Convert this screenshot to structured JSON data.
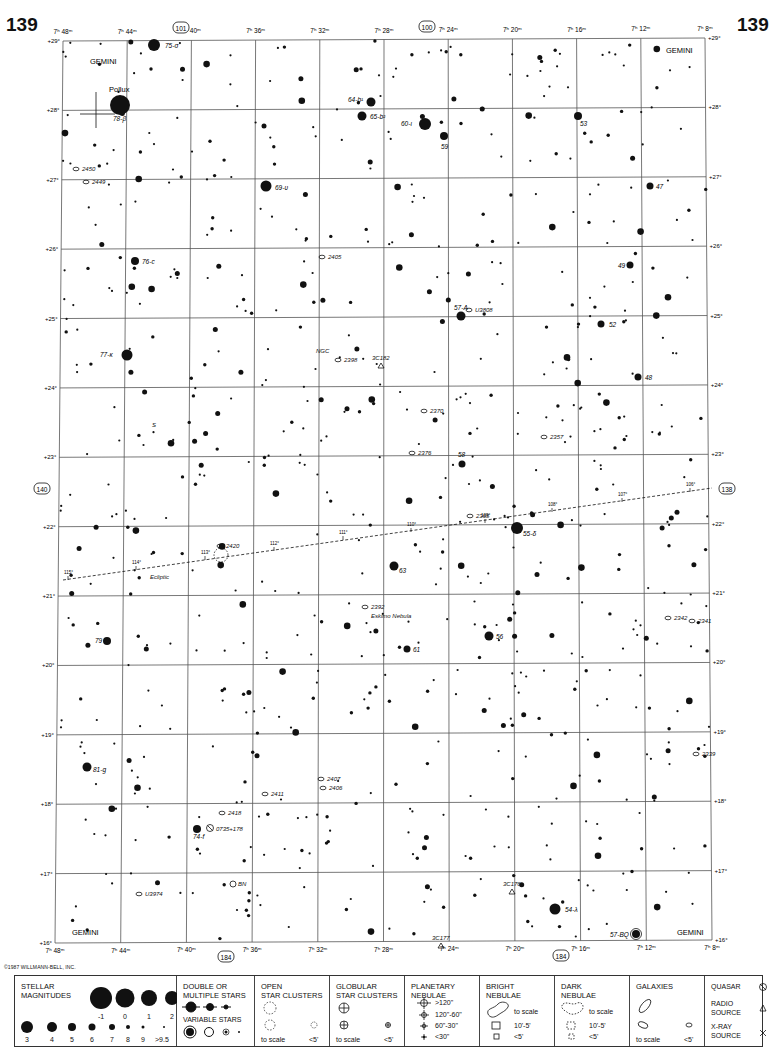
{
  "page": {
    "number_left": "139",
    "number_right": "139",
    "copyright": "©1987 WILLMANN-BELL, INC."
  },
  "chart_frame": {
    "left_top": [
      63,
      41
    ],
    "right_top": [
      705,
      38
    ],
    "left_bottom": [
      55,
      943
    ],
    "right_bottom": [
      712,
      940
    ]
  },
  "ra_labels_top": [
    "7ʰ 48ᵐ",
    "7ʰ 44ᵐ",
    "7ʰ 40ᵐ",
    "7ʰ 36ᵐ",
    "7ʰ 32ᵐ",
    "7ʰ 28ᵐ",
    "7ʰ 24ᵐ",
    "7ʰ 20ᵐ",
    "7ʰ 16ᵐ",
    "7ʰ 12ᵐ",
    "7ʰ 8ᵐ"
  ],
  "ra_labels_bottom": [
    "7ʰ 48ᵐ",
    "7ʰ 44ᵐ",
    "7ʰ 40ᵐ",
    "7ʰ 36ᵐ",
    "7ʰ 32ᵐ",
    "7ʰ 28ᵐ",
    "7ʰ 24ᵐ",
    "7ʰ 20ᵐ",
    "7ʰ 16ᵐ",
    "7ʰ 12ᵐ",
    "7ʰ 8ᵐ"
  ],
  "dec_labels": [
    "+29°",
    "+28°",
    "+27°",
    "+26°",
    "+25°",
    "+24°",
    "+23°",
    "+22°",
    "+21°",
    "+20°",
    "+19°",
    "+18°",
    "+17°",
    "+16°"
  ],
  "adjacent_charts": {
    "top_left": "101",
    "top_right": "100",
    "left": "140",
    "right": "138",
    "bottom_left": "184",
    "bottom_right": "184"
  },
  "constellation_labels": [
    {
      "text": "GEMINI",
      "x": 90,
      "y": 64
    },
    {
      "text": "GEMINI",
      "x": 666,
      "y": 53
    },
    {
      "text": "GEMINI",
      "x": 72,
      "y": 935
    },
    {
      "text": "GEMINI",
      "x": 677,
      "y": 935
    }
  ],
  "named_stars": [
    {
      "name": "Pollux",
      "designation": "78-β",
      "x": 120,
      "y": 105,
      "r": 10,
      "lx": 109,
      "ly": 92,
      "dx": 113,
      "dy": 121
    },
    {
      "name": "",
      "designation": "75-σ",
      "x": 154,
      "y": 45,
      "r": 6,
      "dx": 165,
      "dy": 48
    },
    {
      "name": "",
      "designation": "64-b¹",
      "x": 371,
      "y": 102,
      "r": 4.5,
      "dx": 348,
      "dy": 102
    },
    {
      "name": "",
      "designation": "65-b²",
      "x": 362,
      "y": 116,
      "r": 4.5,
      "dx": 370,
      "dy": 119
    },
    {
      "name": "",
      "designation": "60-ι",
      "x": 425,
      "y": 124,
      "r": 6,
      "dx": 401,
      "dy": 126
    },
    {
      "name": "",
      "designation": "59",
      "x": 444,
      "y": 136,
      "r": 4,
      "dx": 441,
      "dy": 149
    },
    {
      "name": "",
      "designation": "53",
      "x": 578,
      "y": 116,
      "r": 4,
      "dx": 580,
      "dy": 126
    },
    {
      "name": "",
      "designation": "69-υ",
      "x": 266,
      "y": 186,
      "r": 5.5,
      "dx": 275,
      "dy": 190
    },
    {
      "name": "",
      "designation": "47",
      "x": 650,
      "y": 186,
      "r": 3.5,
      "dx": 656,
      "dy": 189
    },
    {
      "name": "",
      "designation": "76-c",
      "x": 135,
      "y": 261,
      "r": 4,
      "dx": 142,
      "dy": 264
    },
    {
      "name": "",
      "designation": "49",
      "x": 630,
      "y": 265,
      "r": 3.5,
      "dx": 618,
      "dy": 268
    },
    {
      "name": "",
      "designation": "57-A",
      "x": 461,
      "y": 316,
      "r": 4.5,
      "dx": 454,
      "dy": 310
    },
    {
      "name": "",
      "designation": "52",
      "x": 601,
      "y": 324,
      "r": 3.5,
      "dx": 609,
      "dy": 327
    },
    {
      "name": "",
      "designation": "77-κ",
      "x": 127,
      "y": 355,
      "r": 5.5,
      "dx": 100,
      "dy": 357
    },
    {
      "name": "",
      "designation": "48",
      "x": 638,
      "y": 377,
      "r": 3.5,
      "dx": 645,
      "dy": 380
    },
    {
      "name": "",
      "designation": "58",
      "x": 462,
      "y": 464,
      "r": 3.5,
      "dx": 458,
      "dy": 457
    },
    {
      "name": "",
      "designation": "55-δ",
      "x": 517,
      "y": 528,
      "r": 6,
      "dx": 523,
      "dy": 536
    },
    {
      "name": "",
      "designation": "63",
      "x": 394,
      "y": 566,
      "r": 4.5,
      "dx": 399,
      "dy": 573
    },
    {
      "name": "",
      "designation": "56",
      "x": 489,
      "y": 636,
      "r": 4.5,
      "dx": 496,
      "dy": 639
    },
    {
      "name": "",
      "designation": "79",
      "x": 107,
      "y": 641,
      "r": 4,
      "dx": 95,
      "dy": 643
    },
    {
      "name": "",
      "designation": "61",
      "x": 407,
      "y": 649,
      "r": 3.5,
      "dx": 413,
      "dy": 652
    },
    {
      "name": "",
      "designation": "81-g",
      "x": 87,
      "y": 767,
      "r": 4.5,
      "dx": 93,
      "dy": 772
    },
    {
      "name": "",
      "designation": "74-f",
      "x": 197,
      "y": 829,
      "r": 4,
      "dx": 193,
      "dy": 839
    },
    {
      "name": "",
      "designation": "54-λ",
      "x": 555,
      "y": 909,
      "r": 5.5,
      "dx": 565,
      "dy": 912
    },
    {
      "name": "",
      "designation": "57-BQ",
      "x": 636,
      "y": 934,
      "r": 4,
      "dx": 610,
      "dy": 937
    }
  ],
  "deep_sky_labels": [
    {
      "text": "2450",
      "x": 82,
      "y": 171
    },
    {
      "text": "2449",
      "x": 92,
      "y": 184
    },
    {
      "text": "2405",
      "x": 328,
      "y": 259
    },
    {
      "text": "U3808",
      "x": 475,
      "y": 312
    },
    {
      "text": "NGC",
      "x": 316,
      "y": 353
    },
    {
      "text": "2398",
      "x": 344,
      "y": 362
    },
    {
      "text": "3C182",
      "x": 372,
      "y": 360
    },
    {
      "text": "2370",
      "x": 430,
      "y": 413
    },
    {
      "text": "S",
      "x": 152,
      "y": 427
    },
    {
      "text": "2357",
      "x": 550,
      "y": 439
    },
    {
      "text": "2376",
      "x": 418,
      "y": 455
    },
    {
      "text": "2365",
      "x": 476,
      "y": 518
    },
    {
      "text": "2420",
      "x": 226,
      "y": 548
    },
    {
      "text": "Ecliptic",
      "x": 150,
      "y": 579
    },
    {
      "text": "2392",
      "x": 371,
      "y": 609
    },
    {
      "text": "Eskimo Nebula",
      "x": 371,
      "y": 618
    },
    {
      "text": "2342",
      "x": 674,
      "y": 620
    },
    {
      "text": "2341",
      "x": 698,
      "y": 623
    },
    {
      "text": "2339",
      "x": 702,
      "y": 756
    },
    {
      "text": "2407",
      "x": 327,
      "y": 781
    },
    {
      "text": "2406",
      "x": 329,
      "y": 790
    },
    {
      "text": "2411",
      "x": 271,
      "y": 796
    },
    {
      "text": "2418",
      "x": 228,
      "y": 815
    },
    {
      "text": "0735+178",
      "x": 216,
      "y": 831
    },
    {
      "text": "BN",
      "x": 238,
      "y": 886
    },
    {
      "text": "U3974",
      "x": 145,
      "y": 896
    },
    {
      "text": "3C176",
      "x": 503,
      "y": 886
    },
    {
      "text": "3C177",
      "x": 432,
      "y": 940
    }
  ],
  "ecliptic": {
    "start": [
      63,
      580
    ],
    "end": [
      712,
      488
    ],
    "ticks": [
      {
        "label": "115°",
        "x": 68,
        "y": 578
      },
      {
        "label": "114°",
        "x": 136,
        "y": 568
      },
      {
        "label": "113°",
        "x": 205,
        "y": 558
      },
      {
        "label": "112°",
        "x": 274,
        "y": 549
      },
      {
        "label": "111°",
        "x": 343,
        "y": 538
      },
      {
        "label": "110°",
        "x": 411,
        "y": 530
      },
      {
        "label": "109°",
        "x": 485,
        "y": 521
      },
      {
        "label": "108°",
        "x": 552,
        "y": 510
      },
      {
        "label": "107°",
        "x": 622,
        "y": 500
      },
      {
        "label": "106°",
        "x": 690,
        "y": 490
      }
    ]
  },
  "legend": {
    "stellar": {
      "title": "STELLAR\nMAGNITUDES",
      "row1": [
        "-1",
        "0",
        "1",
        "2"
      ],
      "row2": [
        "3",
        "4",
        "5",
        "6",
        "7",
        "8",
        "9",
        ">9.5"
      ]
    },
    "double": {
      "title": "DOUBLE OR\nMULTIPLE STARS",
      "variable_title": "VARIABLE STARS"
    },
    "open_clusters": {
      "title": "OPEN\nSTAR CLUSTERS",
      "to_scale": "to scale",
      "small": "<5'"
    },
    "globular": {
      "title": "GLOBULAR\nSTAR CLUSTERS",
      "to_scale": "to scale",
      "small": "<5'"
    },
    "planetary": {
      "title": "PLANETARY\nNEBULAE",
      "items": [
        ">120\"",
        "120\"-60\"",
        "60\"-30\"",
        "<30\""
      ]
    },
    "bright": {
      "title": "BRIGHT\nNEBULAE",
      "to_scale": "to scale",
      "mid": "10'-5'",
      "small": "<5'"
    },
    "dark": {
      "title": "DARK\nNEBULAE",
      "to_scale": "to scale",
      "mid": "10'-5'",
      "small": "<5'"
    },
    "galaxies": {
      "title": "GALAXIES",
      "to_scale": "to scale",
      "small": "<5'"
    },
    "misc": {
      "quasar": "QUASAR",
      "radio": "RADIO\nSOURCE",
      "xray": "X-RAY\nSOURCE"
    }
  }
}
